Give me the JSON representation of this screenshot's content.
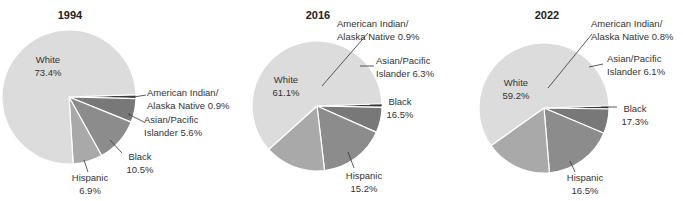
{
  "colors": {
    "White": "#dcdcdc",
    "Hispanic": "#a9a9a9",
    "Black": "#8c8c8c",
    "Asian/Pacific Islander": "#787878",
    "American Indian/Alaska Native": "#3a3a3a",
    "separator": "#ffffff",
    "leader": "#333333"
  },
  "chart_data": [
    {
      "type": "pie",
      "title": "1994",
      "categories": [
        "White",
        "American Indian/Alaska Native",
        "Asian/Pacific Islander",
        "Black",
        "Hispanic"
      ],
      "values": [
        73.4,
        0.9,
        5.6,
        10.5,
        6.9
      ],
      "labels": [
        {
          "line1": "White",
          "line2": "73.4%"
        },
        {
          "line1": "American Indian/",
          "line2": "Alaska Native 0.9%"
        },
        {
          "line1": "Asian/Pacific",
          "line2": "Islander 5.6%"
        },
        {
          "line1": "Black",
          "line2": "10.5%"
        },
        {
          "line1": "Hispanic",
          "line2": "6.9%"
        }
      ],
      "legend": "none (direct labels)"
    },
    {
      "type": "pie",
      "title": "2016",
      "categories": [
        "White",
        "American Indian/Alaska Native",
        "Asian/Pacific Islander",
        "Black",
        "Hispanic"
      ],
      "values": [
        61.1,
        0.9,
        6.3,
        16.5,
        15.2
      ],
      "labels": [
        {
          "line1": "White",
          "line2": "61.1%"
        },
        {
          "line1": "American Indian/",
          "line2": "Alaska Native 0.9%"
        },
        {
          "line1": "Asian/Pacific",
          "line2": "Islander 6.3%"
        },
        {
          "line1": "Black",
          "line2": "16.5%"
        },
        {
          "line1": "Hispanic",
          "line2": "15.2%"
        }
      ],
      "legend": "none (direct labels)"
    },
    {
      "type": "pie",
      "title": "2022",
      "categories": [
        "White",
        "American Indian/Alaska Native",
        "Asian/Pacific Islander",
        "Black",
        "Hispanic"
      ],
      "values": [
        59.2,
        0.8,
        6.1,
        17.3,
        16.5
      ],
      "labels": [
        {
          "line1": "White",
          "line2": "59.2%"
        },
        {
          "line1": "American Indian/",
          "line2": "Alaska Native 0.8%"
        },
        {
          "line1": "Asian/Pacific",
          "line2": "Islander 6.1%"
        },
        {
          "line1": "Black",
          "line2": "17.3%"
        },
        {
          "line1": "Hispanic",
          "line2": "16.5%"
        }
      ],
      "legend": "none (direct labels)"
    }
  ]
}
